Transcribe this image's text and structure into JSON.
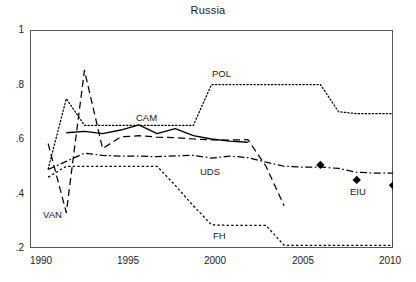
{
  "chart_data": {
    "type": "line",
    "title": "Russia",
    "xlabel": "",
    "ylabel": "",
    "xlim": [
      1990,
      2010
    ],
    "ylim": [
      0.2,
      1.0
    ],
    "xticks": [
      1990,
      1995,
      2000,
      2005,
      2010
    ],
    "xtick_labels": [
      "1990",
      "1995",
      "2000",
      "2005",
      "2010"
    ],
    "yticks": [
      0.2,
      0.4,
      0.6,
      0.8,
      1.0
    ],
    "ytick_labels": [
      ".2",
      ".4",
      ".6",
      ".8",
      "1"
    ],
    "grid": false,
    "legend": "inline-annotations",
    "series": [
      {
        "name": "CAM",
        "label": "CAM",
        "style": "solid",
        "x": [
          1992,
          1993,
          1994,
          1995,
          1996,
          1997,
          1998,
          1999,
          2000,
          2001,
          2002
        ],
        "values": [
          0.623,
          0.628,
          0.62,
          0.633,
          0.652,
          0.62,
          0.638,
          0.612,
          0.6,
          0.592,
          0.588
        ]
      },
      {
        "name": "VAN",
        "label": "VAN",
        "style": "dashed",
        "x": [
          1991,
          1992,
          1993,
          1994,
          1995,
          1996,
          1997,
          1998,
          1999,
          2000,
          2001,
          2002,
          2003,
          2004
        ],
        "values": [
          0.583,
          0.33,
          0.852,
          0.565,
          0.608,
          0.612,
          0.607,
          0.605,
          0.6,
          0.597,
          0.596,
          0.598,
          0.5,
          0.355
        ]
      },
      {
        "name": "POL",
        "label": "POL",
        "style": "dotted",
        "x": [
          1991,
          1992,
          1993,
          1994,
          1995,
          1996,
          1997,
          1998,
          1999,
          2000,
          2001,
          2002,
          2003,
          2004,
          2005,
          2006,
          2007,
          2008,
          2009,
          2010
        ],
        "values": [
          0.49,
          0.748,
          0.65,
          0.65,
          0.65,
          0.65,
          0.65,
          0.65,
          0.65,
          0.8,
          0.8,
          0.8,
          0.8,
          0.8,
          0.8,
          0.8,
          0.7,
          0.693,
          0.693,
          0.693
        ]
      },
      {
        "name": "UDS",
        "label": "UDS",
        "style": "dashdot",
        "x": [
          1991,
          1992,
          1993,
          1994,
          1995,
          1996,
          1997,
          1998,
          1999,
          2000,
          2001,
          2002,
          2003,
          2004,
          2005,
          2006,
          2007,
          2008,
          2009,
          2010
        ],
        "values": [
          0.488,
          0.518,
          0.548,
          0.54,
          0.537,
          0.537,
          0.535,
          0.538,
          0.54,
          0.53,
          0.537,
          0.532,
          0.515,
          0.5,
          0.497,
          0.497,
          0.492,
          0.478,
          0.475,
          0.475
        ]
      },
      {
        "name": "FH",
        "label": "FH",
        "style": "dotted-dense",
        "x": [
          1991,
          1992,
          1993,
          1994,
          1995,
          1996,
          1997,
          1998,
          1999,
          2000,
          2001,
          2002,
          2003,
          2004,
          2005,
          2006,
          2007,
          2008,
          2009,
          2010
        ],
        "values": [
          0.46,
          0.5,
          0.5,
          0.5,
          0.5,
          0.5,
          0.5,
          0.43,
          0.355,
          0.285,
          0.283,
          0.283,
          0.283,
          0.21,
          0.21,
          0.21,
          0.21,
          0.21,
          0.21,
          0.21
        ]
      },
      {
        "name": "EIU",
        "label": "EIU",
        "style": "markers-diamond",
        "x": [
          2006,
          2008,
          2010
        ],
        "values": [
          0.505,
          0.45,
          0.43
        ]
      }
    ],
    "annotations": [
      {
        "text": "CAM",
        "x": 1996.3,
        "y": 0.682
      },
      {
        "text": "VAN",
        "x": 1991.0,
        "y": 0.325
      },
      {
        "text": "POL",
        "x": 2000.3,
        "y": 0.838
      },
      {
        "text": "UDS",
        "x": 1999.5,
        "y": 0.492
      },
      {
        "text": "FH",
        "x": 2000.8,
        "y": 0.258
      },
      {
        "text": "EIU",
        "x": 2008.2,
        "y": 0.408
      }
    ]
  },
  "colors": {
    "line": "#000000",
    "axis": "#555555",
    "text": "#1a1a1a",
    "background": "#ffffff"
  }
}
